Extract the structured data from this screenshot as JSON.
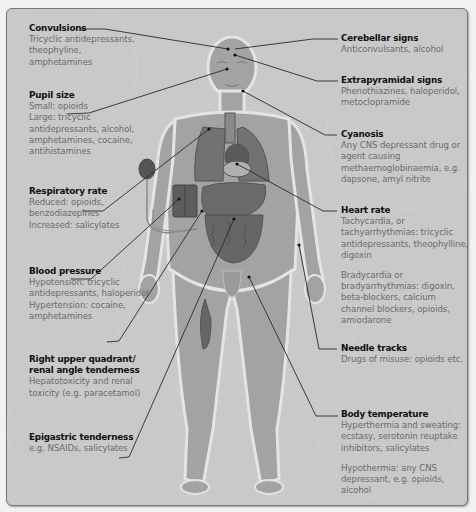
{
  "diagram": {
    "type": "annotated human body figure — clinical signs of poisoning",
    "colors": {
      "panel_background": "#c9c9c9",
      "body_fill": "#9a9a9a",
      "organ_fill": "#6f6f6f",
      "heading_text": "#111111",
      "body_text": "#6b6b6b",
      "leader_line": "#2a2a2a"
    },
    "annotations_left": [
      {
        "title": "Convulsions",
        "lines": [
          "Tricyclic antidepressants,",
          "theophyline,",
          "amphetamines"
        ]
      },
      {
        "title": "Pupil size",
        "lines": [
          "Small: opioids",
          "Large: tricyclic",
          "antidepressants, alcohol,",
          "amphetamines, cocaine,",
          "antihistamines"
        ]
      },
      {
        "title": "Respiratory rate",
        "lines": [
          "Reduced: opioids,",
          "benzodiazepines",
          "Increased: salicylates"
        ]
      },
      {
        "title": "Blood pressure",
        "lines": [
          "Hypotension: tricyclic",
          "antidepressants, haloperidol",
          "Hypertension: cocaine,",
          "amphetamines"
        ]
      },
      {
        "title_lines": [
          "Right upper quadrant/",
          "renal angle tenderness"
        ],
        "lines": [
          "Hepatotoxicity and renal",
          "toxicity (e.g. paracetamol)"
        ]
      },
      {
        "title": "Epigastric tenderness",
        "lines": [
          "e.g. NSAIDs, salicylates"
        ]
      }
    ],
    "annotations_right": [
      {
        "title": "Cerebellar signs",
        "lines": [
          "Anticonvulsants, alcohol"
        ]
      },
      {
        "title": "Extrapyramidal signs",
        "lines": [
          "Phenothiazines, haloperidol,",
          "metoclopramide"
        ]
      },
      {
        "title": "Cyanosis",
        "lines": [
          "Any CNS depressant drug or",
          "agent causing",
          "methaemoglobinaemia, e.g.",
          "dapsone, amyl nitrite"
        ]
      },
      {
        "title": "Heart rate",
        "lines": [
          "Tachycardia, or",
          "tachyarrhythmias: tricyclic",
          "antidepressants, theophylline,",
          "digoxin"
        ],
        "lines2": [
          "Bradycardia or",
          "bradyarrhythmias: digoxin,",
          "beta-blockers, calcium",
          "channel blockers, opioids,",
          "amiodarone"
        ]
      },
      {
        "title": "Needle tracks",
        "lines": [
          "Drugs of misuse: opioids etc."
        ]
      },
      {
        "title": "Body temperature",
        "lines": [
          "Hyperthermia and sweating:",
          "ecstasy, serotonin reuptake",
          "inhibitors, salicylates"
        ],
        "lines2": [
          "Hypothermia: any CNS",
          "depressant, e.g. opioids,",
          "alcohol"
        ]
      }
    ]
  }
}
